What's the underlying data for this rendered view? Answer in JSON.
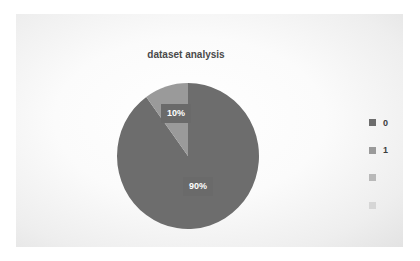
{
  "chart_data": {
    "type": "pie",
    "title": "dataset analysis",
    "categories": [
      "0",
      "1",
      "",
      ""
    ],
    "values": [
      90,
      10,
      0,
      0
    ],
    "data_labels": [
      "90%",
      "10%"
    ],
    "colors": [
      "#6d6d6d",
      "#9a9a9a",
      "#b9b9b9",
      "#d6d6d6"
    ],
    "legend_position": "right"
  },
  "chart": {
    "title": "dataset analysis",
    "labels": {
      "slice0": "90%",
      "slice1": "10%"
    },
    "legend": [
      {
        "label": "0",
        "color": "#6d6d6d"
      },
      {
        "label": "1",
        "color": "#9a9a9a"
      },
      {
        "label": "",
        "color": "#b9b9b9"
      },
      {
        "label": "",
        "color": "#d6d6d6"
      }
    ]
  }
}
